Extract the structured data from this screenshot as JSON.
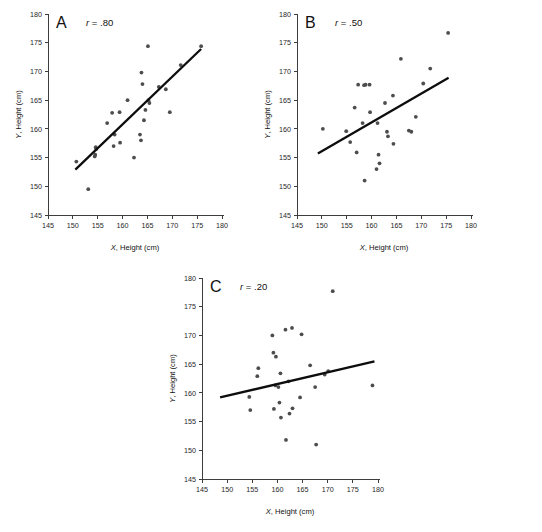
{
  "figure": {
    "title": "",
    "panel_count": 3,
    "point_color": "#4d4d4d",
    "line_color": "#0d0d0d",
    "axis_color": "#3d3d3d"
  },
  "axes_common": {
    "xlabel_italic": "X",
    "xlabel_rest": ", Height (cm)",
    "ylabel_italic": "Y",
    "ylabel_rest": ", Height (cm)",
    "xlim": [
      145,
      180
    ],
    "ylim": [
      145,
      180
    ],
    "xticks": [
      145,
      150,
      155,
      160,
      165,
      170,
      175,
      180
    ],
    "yticks": [
      145,
      150,
      155,
      160,
      165,
      170,
      175,
      180
    ],
    "xtick_labels": [
      "145",
      "150",
      "155",
      "160",
      "165",
      "170",
      "175",
      "180"
    ],
    "ytick_labels": [
      "145",
      "150",
      "155",
      "160",
      "165",
      "170",
      "175",
      "180"
    ],
    "grid": false,
    "legend": "none"
  },
  "chart_data": [
    {
      "type": "scatter",
      "panel": "A",
      "panel_letter": "A",
      "title": "",
      "annotation_italic": "r",
      "annotation_rest": " = .80",
      "r": 0.8,
      "xlabel": "X, Height (cm)",
      "ylabel": "Y, Height (cm)",
      "xlim": [
        145,
        180
      ],
      "ylim": [
        145,
        180
      ],
      "grid": false,
      "points": [
        [
          150.7,
          154.3
        ],
        [
          153.1,
          149.5
        ],
        [
          154.4,
          155.2
        ],
        [
          154.5,
          155.5
        ],
        [
          154.6,
          156.8
        ],
        [
          154.7,
          156.5
        ],
        [
          156.9,
          161.0
        ],
        [
          157.9,
          162.8
        ],
        [
          158.2,
          157.0
        ],
        [
          158.4,
          159.0
        ],
        [
          159.4,
          162.9
        ],
        [
          159.5,
          157.6
        ],
        [
          161.0,
          165.0
        ],
        [
          162.3,
          155.0
        ],
        [
          163.5,
          159.0
        ],
        [
          163.7,
          158.0
        ],
        [
          163.8,
          169.8
        ],
        [
          164.0,
          167.8
        ],
        [
          164.3,
          161.5
        ],
        [
          164.6,
          163.3
        ],
        [
          165.1,
          174.4
        ],
        [
          165.2,
          165.0
        ],
        [
          165.4,
          164.5
        ],
        [
          167.3,
          167.3
        ],
        [
          168.7,
          166.9
        ],
        [
          169.5,
          162.9
        ],
        [
          171.7,
          171.1
        ],
        [
          175.8,
          174.4
        ]
      ],
      "fit_line": {
        "x": [
          150.5,
          175.8
        ],
        "y": [
          152.9,
          173.9
        ]
      }
    },
    {
      "type": "scatter",
      "panel": "B",
      "panel_letter": "B",
      "title": "",
      "annotation_italic": "r",
      "annotation_rest": " = .50",
      "r": 0.5,
      "xlabel": "X, Height (cm)",
      "ylabel": "Y, Height (cm)",
      "xlim": [
        145,
        180
      ],
      "ylim": [
        145,
        180
      ],
      "grid": false,
      "points": [
        [
          150.2,
          160.0
        ],
        [
          154.9,
          159.6
        ],
        [
          155.7,
          157.7
        ],
        [
          156.6,
          163.7
        ],
        [
          157.0,
          155.9
        ],
        [
          157.3,
          167.7
        ],
        [
          158.2,
          161.0
        ],
        [
          158.5,
          167.6
        ],
        [
          158.6,
          151.0
        ],
        [
          158.8,
          167.7
        ],
        [
          159.6,
          167.7
        ],
        [
          159.7,
          162.9
        ],
        [
          161.0,
          153.0
        ],
        [
          161.2,
          161.0
        ],
        [
          161.4,
          155.5
        ],
        [
          161.6,
          154.0
        ],
        [
          162.7,
          164.5
        ],
        [
          163.1,
          159.5
        ],
        [
          163.3,
          158.7
        ],
        [
          164.3,
          165.8
        ],
        [
          164.4,
          157.4
        ],
        [
          165.9,
          172.2
        ],
        [
          167.5,
          159.7
        ],
        [
          168.0,
          159.5
        ],
        [
          168.9,
          162.1
        ],
        [
          170.4,
          167.9
        ],
        [
          171.8,
          170.5
        ],
        [
          175.4,
          176.7
        ]
      ],
      "fit_line": {
        "x": [
          149.2,
          175.5
        ],
        "y": [
          155.7,
          168.9
        ]
      }
    },
    {
      "type": "scatter",
      "panel": "C",
      "panel_letter": "C",
      "title": "",
      "annotation_italic": "r",
      "annotation_rest": " = .20",
      "r": 0.2,
      "xlabel": "X, Height (cm)",
      "ylabel": "Y, Height (cm)",
      "xlim": [
        145,
        180
      ],
      "ylim": [
        145,
        180
      ],
      "grid": false,
      "points": [
        [
          154.4,
          159.3
        ],
        [
          154.6,
          157.0
        ],
        [
          156.0,
          162.9
        ],
        [
          156.2,
          164.3
        ],
        [
          159.0,
          170.0
        ],
        [
          159.2,
          167.0
        ],
        [
          159.3,
          157.2
        ],
        [
          159.6,
          161.3
        ],
        [
          159.7,
          166.3
        ],
        [
          160.2,
          161.0
        ],
        [
          160.4,
          158.3
        ],
        [
          160.6,
          163.4
        ],
        [
          160.7,
          155.7
        ],
        [
          161.6,
          171.0
        ],
        [
          161.7,
          151.8
        ],
        [
          162.2,
          162.0
        ],
        [
          162.4,
          156.4
        ],
        [
          162.9,
          171.3
        ],
        [
          163.0,
          157.3
        ],
        [
          164.5,
          159.2
        ],
        [
          164.8,
          170.2
        ],
        [
          166.5,
          164.8
        ],
        [
          167.5,
          161.0
        ],
        [
          167.7,
          151.0
        ],
        [
          169.4,
          163.2
        ],
        [
          170.1,
          163.8
        ],
        [
          171.0,
          177.7
        ],
        [
          178.9,
          161.3
        ]
      ],
      "fit_line": {
        "x": [
          148.6,
          179.3
        ],
        "y": [
          159.2,
          165.5
        ]
      }
    }
  ]
}
